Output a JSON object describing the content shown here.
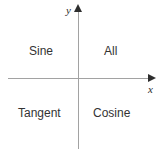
{
  "diagram": {
    "type": "cartesian-quadrant-diagram",
    "axes": {
      "x_label": "x",
      "y_label": "y",
      "line_color": "#a2a2a2",
      "arrow_color": "#2e2e2e",
      "x_arrow_icon": "arrow-right-icon",
      "y_arrow_icon": "arrow-up-icon"
    },
    "text_color": "#333333",
    "background_color": "#ffffff",
    "quadrants": [
      {
        "id": "quadrant-1",
        "position": "top-right",
        "label": "All"
      },
      {
        "id": "quadrant-2",
        "position": "top-left",
        "label": "Sine"
      },
      {
        "id": "quadrant-3",
        "position": "bottom-left",
        "label": "Tangent"
      },
      {
        "id": "quadrant-4",
        "position": "bottom-right",
        "label": "Cosine"
      }
    ]
  }
}
